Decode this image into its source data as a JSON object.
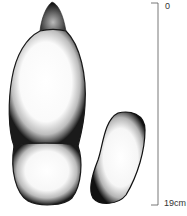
{
  "figure": {
    "specimens": [
      {
        "name": "elongated-lobed-specimen",
        "parts": [
          "tip",
          "upper-lobe",
          "lower-lobe"
        ]
      },
      {
        "name": "kidney-shaped-specimen"
      }
    ]
  },
  "scale_bar": {
    "top_label": "0",
    "bottom_label": "19cm"
  },
  "colors": {
    "ink": "#1a1a1a",
    "background": "#ffffff"
  }
}
